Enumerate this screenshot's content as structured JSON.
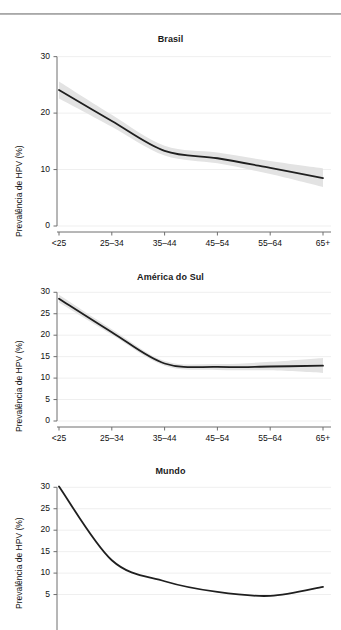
{
  "figure": {
    "ylabel": "Prevalência de HPV (%)",
    "xcategories": [
      "<25",
      "25–34",
      "35–44",
      "45–54",
      "55–64",
      "65+"
    ],
    "colors": {
      "line": "#1f1f1f",
      "band": "#e3e3e3",
      "grid": "#efefef",
      "axis": "#6f6f6f",
      "text": "#111111",
      "rule": "#9a9a9a"
    }
  },
  "chart_data": [
    {
      "type": "line",
      "title": "Brasil",
      "xlabel": "",
      "ylabel": "Prevalência de HPV (%)",
      "categories": [
        "<25",
        "25–34",
        "35–44",
        "45–54",
        "55–64",
        "65+"
      ],
      "values": [
        24.1,
        18.6,
        13.3,
        12.0,
        10.3,
        8.5
      ],
      "ci_lower": [
        22.6,
        17.6,
        12.5,
        11.1,
        9.2,
        6.9
      ],
      "ci_upper": [
        25.6,
        19.7,
        14.2,
        13.0,
        11.5,
        10.2
      ],
      "ylim": [
        0,
        31
      ],
      "yticks": [
        0,
        10,
        20,
        30
      ],
      "grid": true,
      "legend": "none",
      "band_label": "95% CI"
    },
    {
      "type": "line",
      "title": "América do Sul",
      "xlabel": "",
      "ylabel": "Prevalência de HPV (%)",
      "categories": [
        "<25",
        "25–34",
        "35–44",
        "45–54",
        "55–64",
        "65+"
      ],
      "values": [
        28.5,
        20.7,
        13.4,
        12.6,
        12.7,
        12.9
      ],
      "ci_lower": [
        27.6,
        20.1,
        12.9,
        11.9,
        11.8,
        11.2
      ],
      "ci_upper": [
        29.4,
        21.4,
        14.0,
        13.3,
        13.8,
        14.7
      ],
      "ylim": [
        0,
        31
      ],
      "yticks": [
        0,
        5,
        10,
        15,
        20,
        25,
        30
      ],
      "grid": true,
      "legend": "none",
      "band_label": "95% CI"
    },
    {
      "type": "line",
      "title": "Mundo",
      "xlabel": "",
      "ylabel": "Prevalência de HPV (%)",
      "categories": [
        "<25",
        "25–34",
        "35–44",
        "45–54",
        "55–64",
        "65+"
      ],
      "values": [
        30.2,
        13.0,
        8.1,
        5.6,
        4.7,
        6.8
      ],
      "ylim": [
        0,
        31
      ],
      "yticks": [
        5,
        10,
        15,
        20,
        25,
        30
      ],
      "grid": true,
      "legend": "none",
      "note": "panel cropped at bottom of image"
    }
  ]
}
